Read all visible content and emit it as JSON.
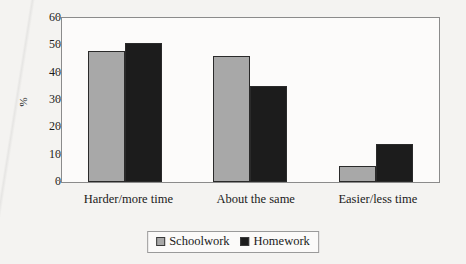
{
  "chart_data": {
    "type": "bar",
    "title": "",
    "xlabel": "",
    "ylabel": "%",
    "categories": [
      "Harder/more time",
      "About the same",
      "Easier/less time"
    ],
    "series": [
      {
        "name": "Schoolwork",
        "color": "#a8a8a8",
        "values": [
          48,
          46,
          6
        ]
      },
      {
        "name": "Homework",
        "color": "#1c1c1c",
        "values": [
          51,
          35,
          14
        ]
      }
    ],
    "ylim": [
      0,
      60
    ],
    "yticks": [
      0,
      10,
      20,
      30,
      40,
      50,
      60
    ],
    "ytick_labels": [
      "0",
      "10",
      "20",
      "30",
      "40",
      "50",
      "60"
    ],
    "grid": false,
    "legend_position": "bottom-center"
  },
  "axis": {
    "y_label": "%"
  },
  "legend": {
    "entries": [
      {
        "label": "Schoolwork",
        "swatch": "gray-square-icon"
      },
      {
        "label": "Homework",
        "swatch": "black-square-icon"
      }
    ]
  }
}
